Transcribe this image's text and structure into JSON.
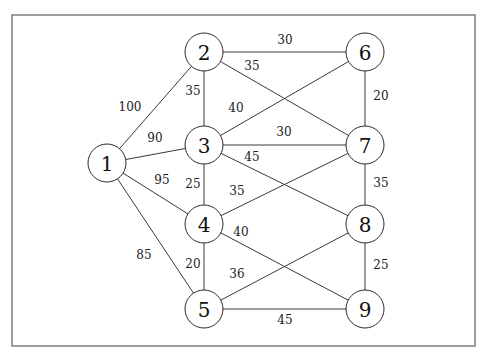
{
  "diagram": {
    "type": "weighted-undirected-graph",
    "frame": {
      "x": 12,
      "y": 15,
      "width": 463,
      "height": 331
    },
    "node_radius": 19,
    "nodes": [
      {
        "id": "1",
        "label": "1",
        "x": 107,
        "y": 163
      },
      {
        "id": "2",
        "label": "2",
        "x": 204,
        "y": 52
      },
      {
        "id": "3",
        "label": "3",
        "x": 204,
        "y": 145
      },
      {
        "id": "4",
        "label": "4",
        "x": 204,
        "y": 224
      },
      {
        "id": "5",
        "label": "5",
        "x": 204,
        "y": 309
      },
      {
        "id": "6",
        "label": "6",
        "x": 365,
        "y": 52
      },
      {
        "id": "7",
        "label": "7",
        "x": 365,
        "y": 145
      },
      {
        "id": "8",
        "label": "8",
        "x": 365,
        "y": 224
      },
      {
        "id": "9",
        "label": "9",
        "x": 365,
        "y": 309
      }
    ],
    "edges": [
      {
        "from": "1",
        "to": "2",
        "weight": "100",
        "lx": 130,
        "ly": 107
      },
      {
        "from": "1",
        "to": "3",
        "weight": "90",
        "lx": 155,
        "ly": 138
      },
      {
        "from": "1",
        "to": "4",
        "weight": "95",
        "lx": 162,
        "ly": 180
      },
      {
        "from": "1",
        "to": "5",
        "weight": "85",
        "lx": 144,
        "ly": 255
      },
      {
        "from": "2",
        "to": "3",
        "weight": "35",
        "lx": 193,
        "ly": 91
      },
      {
        "from": "2",
        "to": "6",
        "weight": "30",
        "lx": 285,
        "ly": 40
      },
      {
        "from": "2",
        "to": "7",
        "weight": "35",
        "lx": 252,
        "ly": 66
      },
      {
        "from": "3",
        "to": "6",
        "weight": "40",
        "lx": 236,
        "ly": 108
      },
      {
        "from": "3",
        "to": "7",
        "weight": "30",
        "lx": 284,
        "ly": 132
      },
      {
        "from": "3",
        "to": "8",
        "weight": "45",
        "lx": 252,
        "ly": 157
      },
      {
        "from": "3",
        "to": "4",
        "weight": "25",
        "lx": 193,
        "ly": 184
      },
      {
        "from": "4",
        "to": "7",
        "weight": "35",
        "lx": 237,
        "ly": 191
      },
      {
        "from": "4",
        "to": "9",
        "weight": "40",
        "lx": 241,
        "ly": 232
      },
      {
        "from": "4",
        "to": "5",
        "weight": "20",
        "lx": 193,
        "ly": 264
      },
      {
        "from": "5",
        "to": "8",
        "weight": "36",
        "lx": 237,
        "ly": 274
      },
      {
        "from": "5",
        "to": "9",
        "weight": "45",
        "lx": 285,
        "ly": 320
      },
      {
        "from": "6",
        "to": "7",
        "weight": "20",
        "lx": 381,
        "ly": 96
      },
      {
        "from": "7",
        "to": "8",
        "weight": "35",
        "lx": 381,
        "ly": 183
      },
      {
        "from": "8",
        "to": "9",
        "weight": "25",
        "lx": 381,
        "ly": 265
      }
    ]
  }
}
